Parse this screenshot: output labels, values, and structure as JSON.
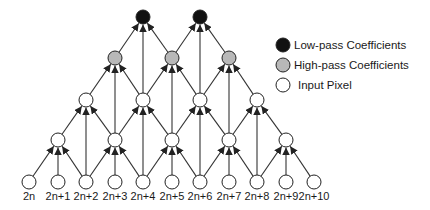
{
  "diagram": {
    "title": "",
    "legend": [
      {
        "label": "Low-pass Coefficients",
        "fill": "#111111"
      },
      {
        "label": "High-pass Coefficients",
        "fill": "#b8b8b8"
      },
      {
        "label": "Input Pixel",
        "fill": "#ffffff"
      }
    ],
    "input_labels": [
      "2n",
      "2n+1",
      "2n+2",
      "2n+3",
      "2n+4",
      "2n+5",
      "2n+6",
      "2n+7",
      "2n+8",
      "2n+9",
      "2n+10"
    ],
    "colors": {
      "edge": "#333333",
      "node_stroke": "#222222",
      "low": "#111111",
      "high": "#b8b8b8",
      "input": "#ffffff"
    },
    "levels": [
      {
        "name": "input",
        "y": 182,
        "x": [
          29,
          58,
          86,
          115,
          143,
          172,
          200,
          229,
          257,
          286,
          314
        ],
        "type": "input"
      },
      {
        "name": "level1",
        "y": 140,
        "x": [
          58,
          115,
          172,
          229,
          286
        ],
        "type": "input"
      },
      {
        "name": "level2",
        "y": 100,
        "x": [
          86,
          143,
          200,
          257
        ],
        "type": "input"
      },
      {
        "name": "level3",
        "y": 58,
        "x": [
          115,
          172,
          229
        ],
        "type": "high"
      },
      {
        "name": "level4",
        "y": 17,
        "x": [
          143,
          200
        ],
        "type": "low"
      }
    ]
  }
}
